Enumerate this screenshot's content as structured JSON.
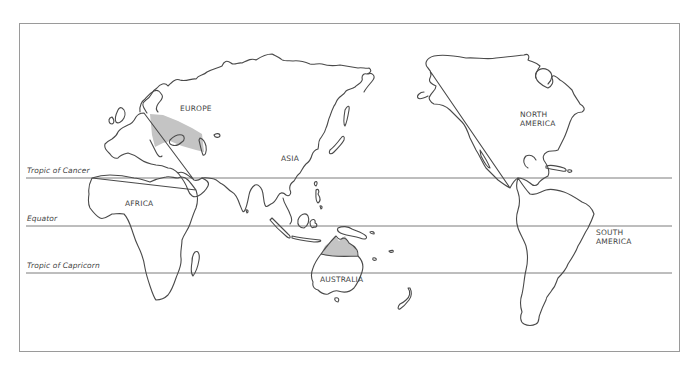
{
  "map": {
    "type": "world outline map (Pacific-centered)",
    "continents": {
      "europe": "EUROPE",
      "asia": "ASIA",
      "africa": "AFRICA",
      "australia": "AUSTRALIA",
      "north_america_line1": "NORTH",
      "north_america_line2": "AMERICA",
      "south_america_line1": "SOUTH",
      "south_america_line2": "AMERICA"
    },
    "latitude_lines": {
      "tropic_of_cancer": "Tropic of Cancer",
      "equator": "Equator",
      "tropic_of_capricorn": "Tropic of Capricorn"
    },
    "shaded_regions": [
      "Central/Eastern Europe",
      "Northern Australia"
    ],
    "colors": {
      "outline": "#4a4a4a",
      "shaded": "#c4c4c4",
      "frame": "#9a9a9a",
      "background": "#ffffff"
    }
  }
}
